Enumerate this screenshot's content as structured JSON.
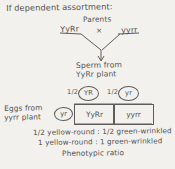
{
  "diagram": {
    "title": "If dependent assortment:",
    "parents_label": "Parents",
    "parent_left": "YyRr",
    "cross_symbol": "×",
    "parent_right": "yyrr",
    "sperm_label_line1": "Sperm from",
    "sperm_label_line2": "YyRr plant",
    "eggs_label_line1": "Eggs from",
    "eggs_label_line2": "yyrr plant",
    "gametes_sperm": [
      {
        "fraction": "1/2",
        "allele": "YR"
      },
      {
        "fraction": "1/2",
        "allele": "yr"
      }
    ],
    "gamete_egg": "yr",
    "punnett_cells": [
      "YyRr",
      "yyrr"
    ],
    "ratio_line1": "1/2 yellow-round : 1/2 green-wrinkled",
    "ratio_line2": "1 yellow-round : 1 green-wrinkled",
    "ratio_caption": "Phenotypic ratio",
    "ink_color": "#53524f",
    "paper_color": "#f2f1ee"
  }
}
